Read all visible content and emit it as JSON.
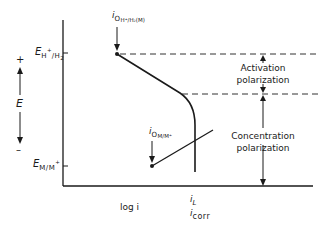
{
  "diagram": {
    "type": "polarization-diagram",
    "axes": {
      "y_label": "E",
      "y_plus": "+",
      "y_minus": "–",
      "x_label": "log i",
      "y_ticks": [
        {
          "main": "E",
          "sub": "H",
          "sup": "+",
          "tail": "/H",
          "tailsub": "2"
        },
        {
          "main": "E",
          "sub": "M/M",
          "sup": "+"
        }
      ]
    },
    "labels": {
      "i0_hydrogen": {
        "main": "i",
        "sub": "O",
        "subsub": "H⁺/H₂(M)"
      },
      "i0_metal": {
        "main": "i",
        "sub": "O",
        "subsub": "M/M⁺"
      },
      "i_L": {
        "main": "i",
        "sub": "L"
      },
      "i_corr": {
        "main": "i",
        "sub": "corr"
      },
      "activation": [
        "Activation",
        "polarization"
      ],
      "concentration": [
        "Concentration",
        "polarization"
      ]
    },
    "colors": {
      "line": "#1a1a1a",
      "dashed": "#333333",
      "background": "#ffffff"
    }
  }
}
